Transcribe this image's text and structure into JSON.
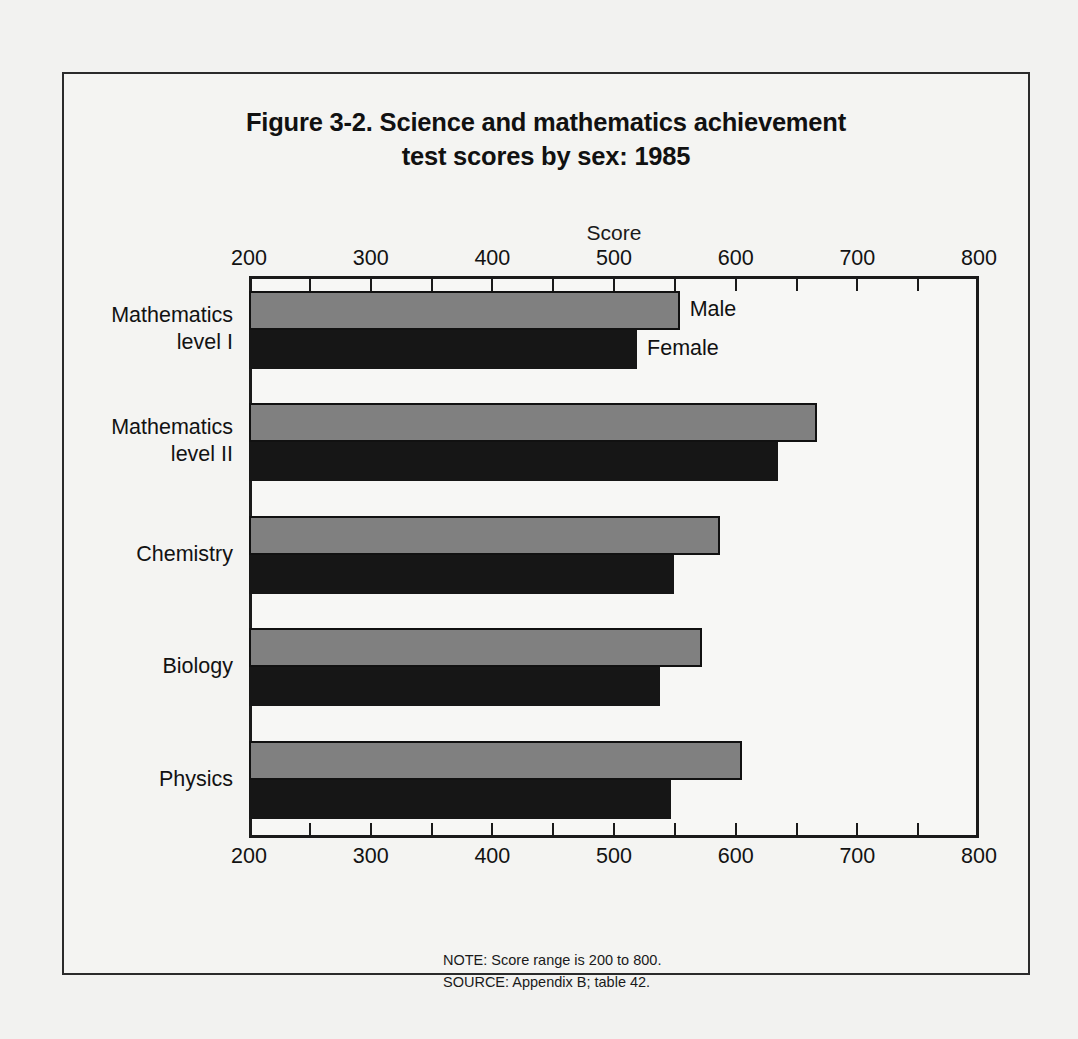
{
  "figure": {
    "title_line1": "Figure 3-2.  Science and mathematics achievement",
    "title_line2": "test scores by sex:  1985",
    "note": "NOTE:  Score range is 200 to 800.",
    "source": "SOURCE:  Appendix B; table 42."
  },
  "chart_data": {
    "type": "bar",
    "orientation": "horizontal",
    "title": "Figure 3-2.  Science and mathematics achievement test scores by sex:  1985",
    "xlabel": "Score",
    "ylabel": "",
    "xlim": [
      200,
      800
    ],
    "xticks": [
      200,
      300,
      400,
      500,
      600,
      700,
      800
    ],
    "xtick_labels": [
      "200",
      "300",
      "400",
      "500",
      "600",
      "700",
      "800"
    ],
    "minor_tick_step": 50,
    "grid": false,
    "legend_position": "inline-annotation-first-group",
    "categories": [
      "Mathematics level I",
      "Mathematics level II",
      "Chemistry",
      "Biology",
      "Physics"
    ],
    "category_labels": [
      {
        "line1": "Mathematics",
        "line2": "level I"
      },
      {
        "line1": "Mathematics",
        "line2": "level II"
      },
      {
        "line1": "Chemistry",
        "line2": ""
      },
      {
        "line1": "Biology",
        "line2": ""
      },
      {
        "line1": "Physics",
        "line2": ""
      }
    ],
    "series": [
      {
        "name": "Male",
        "color": "#808080",
        "values": [
          554,
          667,
          587,
          572,
          605
        ]
      },
      {
        "name": "Female",
        "color": "#161616",
        "values": [
          519,
          635,
          549,
          538,
          547
        ]
      }
    ],
    "annotations": [
      {
        "text": "Male",
        "category": "Mathematics level I",
        "series": "Male"
      },
      {
        "text": "Female",
        "category": "Mathematics level I",
        "series": "Female"
      }
    ]
  },
  "colors": {
    "male_bar": "#808080",
    "female_bar": "#161616",
    "axis": "#1a1a1a",
    "page_background": "#f2f2f0"
  }
}
